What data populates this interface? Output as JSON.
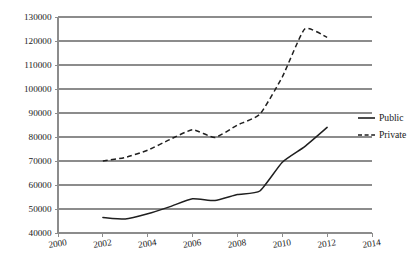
{
  "chart_data": {
    "type": "line",
    "title": "",
    "subtitle": "",
    "xlabel": "",
    "ylabel": "",
    "xlim": [
      2000,
      2014
    ],
    "ylim": [
      40000,
      130000
    ],
    "x_tick_labels": [
      "2000",
      "2002",
      "2004",
      "2006",
      "2008",
      "2010",
      "2012",
      "2014"
    ],
    "x_ticks": [
      2000,
      2002,
      2004,
      2006,
      2008,
      2010,
      2012,
      2014
    ],
    "y_tick_labels": [
      "40000",
      "50000",
      "60000",
      "70000",
      "80000",
      "90000",
      "100000",
      "110000",
      "120000",
      "130000"
    ],
    "y_ticks": [
      40000,
      50000,
      60000,
      70000,
      80000,
      90000,
      100000,
      110000,
      120000,
      130000
    ],
    "grid": "horizontal",
    "legend_position": "right",
    "x": [
      2002,
      2003,
      2004,
      2005,
      2006,
      2007,
      2008,
      2009,
      2010,
      2011,
      2012
    ],
    "series": [
      {
        "name": "Public",
        "style": "solid",
        "color": "#1f1f1f",
        "values": [
          46500,
          45800,
          48000,
          51000,
          54300,
          53500,
          56000,
          57500,
          69500,
          76000,
          84000
        ]
      },
      {
        "name": "Private",
        "style": "dashed",
        "color": "#1f1f1f",
        "values": [
          70000,
          71500,
          74500,
          79000,
          83000,
          79800,
          85000,
          89500,
          105000,
          125000,
          121500
        ]
      }
    ]
  },
  "legend": {
    "entries": [
      {
        "label": "Public"
      },
      {
        "label": "Private"
      }
    ]
  },
  "colors": {
    "gridline": "#8c8c8c",
    "axis": "#8c8c8c",
    "series": "#1f1f1f",
    "text": "#1a1a1a",
    "background": "#ffffff"
  }
}
